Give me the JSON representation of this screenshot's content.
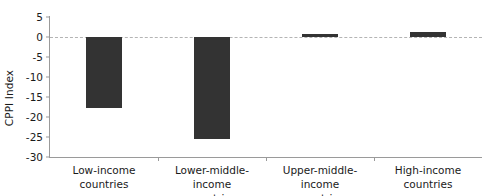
{
  "chart_data": {
    "type": "bar",
    "title": "",
    "xlabel": "",
    "ylabel": "CPPI Index",
    "categories": [
      "Low-income countries",
      "Lower-middle-income countries",
      "Upper-middle-income countries",
      "High-income countries"
    ],
    "category_lines": [
      [
        "Low-income",
        "countries"
      ],
      [
        "Lower-middle-income",
        "countries"
      ],
      [
        "Upper-middle-income",
        "countries"
      ],
      [
        "High-income",
        "countries"
      ]
    ],
    "values": [
      -17.7,
      -25.4,
      0.7,
      1.2
    ],
    "ylim": [
      -30,
      5
    ],
    "yticks": [
      5,
      0,
      -5,
      -10,
      -15,
      -20,
      -25,
      -30
    ],
    "ytick_labels": [
      "5",
      "0",
      "-5",
      "-10",
      "-15",
      "-20",
      "-25",
      "-30"
    ],
    "grid": false,
    "zero_line": true,
    "legend": "none",
    "bar_color": "#333333",
    "axis_color": "#9a9a9a",
    "zero_line_color": "#b4b4b4"
  }
}
